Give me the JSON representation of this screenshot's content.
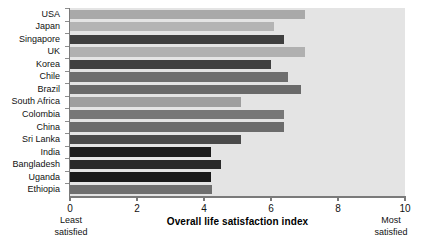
{
  "chart_data": {
    "type": "bar",
    "orientation": "horizontal",
    "title": "",
    "xlabel": "Overall life satisfaction index",
    "ylabel": "",
    "xlim": [
      0,
      10
    ],
    "xticks": [
      0,
      2,
      4,
      6,
      8,
      10
    ],
    "grid": false,
    "legend": "none",
    "categories": [
      "USA",
      "Japan",
      "Singapore",
      "UK",
      "Korea",
      "Chile",
      "Brazil",
      "South Africa",
      "Colombia",
      "China",
      "Sri Lanka",
      "India",
      "Bangladesh",
      "Uganda",
      "Ethiopia"
    ],
    "values": [
      7.0,
      6.1,
      6.4,
      7.0,
      6.0,
      6.5,
      6.9,
      5.1,
      6.4,
      6.4,
      5.1,
      4.2,
      4.5,
      4.2,
      4.25
    ],
    "bar_colors": [
      "#a9a9a9",
      "#b4b4b4",
      "#3f3f3f",
      "#b0b0b0",
      "#404040",
      "#6e6e6e",
      "#6a6a6a",
      "#9e9e9e",
      "#777777",
      "#6b6b6b",
      "#4a4a4a",
      "#1c1c1c",
      "#2a2a2a",
      "#1a1a1a",
      "#6f6f6f",
      "#7b7b7b"
    ],
    "annotations": {
      "left_end": "Least\nsatisfied",
      "right_end": "Most\nsatisfied"
    }
  },
  "axis": {
    "tick_labels": [
      "0",
      "2",
      "4",
      "6",
      "8",
      "10"
    ],
    "x_title": "Overall life satisfaction index"
  },
  "notes": {
    "least_line1": "Least",
    "least_line2": "satisfied",
    "most_line1": "Most",
    "most_line2": "satisfied"
  },
  "colors": {
    "plot_background": "#e4e4e4",
    "axis": "#7a7a7a",
    "text": "#111111"
  }
}
